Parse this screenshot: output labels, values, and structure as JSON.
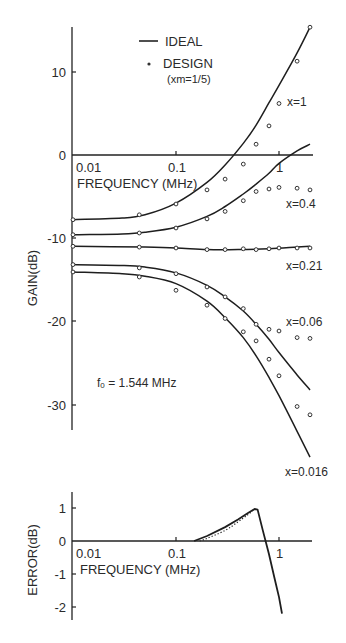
{
  "chart_data": [
    {
      "type": "line",
      "title": "",
      "xlabel": "FREQUENCY (MHz)",
      "ylabel": "GAIN(dB)",
      "xscale": "log",
      "xlim": [
        0.01,
        2.0
      ],
      "ylim": [
        -37,
        15.5
      ],
      "x_ticks": [
        "0.01",
        "0.1",
        "1"
      ],
      "y_ticks": [
        "10",
        "0",
        "-10",
        "-20",
        "-30"
      ],
      "grid": false,
      "legend": {
        "position": "top-center",
        "entries": [
          {
            "label": "IDEAL",
            "style": "solid-line"
          },
          {
            "label": "DESIGN",
            "sublabel": "(xm=1/5)",
            "style": "open-circle"
          }
        ]
      },
      "annotation": "f0 = 1.544 MHz",
      "series": [
        {
          "name": "x=1",
          "label": "x=1",
          "ideal_x": [
            0.01,
            0.03,
            0.05,
            0.1,
            0.2,
            0.3,
            0.45,
            0.6,
            0.8,
            1.0,
            1.5,
            2.0
          ],
          "ideal_y": [
            -7.8,
            -7.6,
            -7.2,
            -5.8,
            -3.3,
            -1.2,
            1.4,
            3.6,
            6.3,
            8.4,
            12.3,
            15.4
          ],
          "design_x": [
            0.01,
            0.044,
            0.1,
            0.2,
            0.3,
            0.45,
            0.6,
            0.8,
            1.0,
            1.5,
            2.0
          ],
          "design_y": [
            -7.8,
            -7.2,
            -5.9,
            -4.2,
            -2.9,
            -1.1,
            1.3,
            3.5,
            6.2,
            11.3,
            15.4
          ]
        },
        {
          "name": "x=0.4",
          "label": "x=0.4",
          "ideal_x": [
            0.01,
            0.03,
            0.05,
            0.1,
            0.2,
            0.3,
            0.45,
            0.6,
            0.8,
            1.0,
            1.5,
            2.0
          ],
          "ideal_y": [
            -9.6,
            -9.5,
            -9.3,
            -8.7,
            -7.4,
            -6.2,
            -4.7,
            -3.5,
            -2.2,
            -1.0,
            0.5,
            1.3
          ],
          "design_x": [
            0.01,
            0.044,
            0.1,
            0.2,
            0.3,
            0.45,
            0.6,
            0.8,
            1.0,
            1.5,
            2.0
          ],
          "design_y": [
            -9.6,
            -9.4,
            -8.8,
            -7.7,
            -6.8,
            -5.5,
            -4.4,
            -4.1,
            -3.9,
            -4.0,
            -4.2
          ]
        },
        {
          "name": "x=0.21",
          "label": "x=0.21",
          "ideal_x": [
            0.01,
            0.05,
            0.1,
            0.2,
            0.4,
            0.8,
            1.5,
            2.0
          ],
          "ideal_y": [
            -11.0,
            -11.1,
            -11.2,
            -11.4,
            -11.4,
            -11.3,
            -11.1,
            -11.0
          ],
          "design_x": [
            0.01,
            0.044,
            0.1,
            0.2,
            0.3,
            0.45,
            0.6,
            0.8,
            1.0,
            1.5,
            2.0
          ],
          "design_y": [
            -11.0,
            -11.1,
            -11.2,
            -11.4,
            -11.4,
            -11.3,
            -11.4,
            -11.3,
            -11.2,
            -11.2,
            -11.2
          ]
        },
        {
          "name": "x=0.06",
          "label": "x=0.06",
          "ideal_x": [
            0.01,
            0.03,
            0.05,
            0.1,
            0.2,
            0.3,
            0.45,
            0.6,
            0.8,
            1.0,
            1.5,
            2.0
          ],
          "ideal_y": [
            -13.2,
            -13.3,
            -13.5,
            -14.2,
            -15.7,
            -17.1,
            -18.8,
            -20.4,
            -22.2,
            -23.8,
            -26.5,
            -28.3
          ],
          "design_x": [
            0.01,
            0.044,
            0.1,
            0.2,
            0.3,
            0.45,
            0.6,
            0.8,
            1.0,
            1.5,
            2.0
          ],
          "design_y": [
            -13.2,
            -13.6,
            -14.3,
            -15.9,
            -17.1,
            -18.5,
            -20.4,
            -21.0,
            -21.2,
            -22.0,
            -22.1
          ]
        },
        {
          "name": "x=0.016",
          "label": "x=0.016",
          "ideal_x": [
            0.01,
            0.03,
            0.05,
            0.1,
            0.2,
            0.3,
            0.45,
            0.6,
            0.8,
            1.0,
            1.5,
            2.0
          ],
          "ideal_y": [
            -14.1,
            -14.3,
            -14.6,
            -15.5,
            -17.6,
            -19.6,
            -22.0,
            -24.2,
            -26.8,
            -29.0,
            -33.3,
            -36.4
          ],
          "design_x": [
            0.01,
            0.044,
            0.1,
            0.2,
            0.3,
            0.45,
            0.6,
            0.8,
            1.0,
            1.5,
            2.0
          ],
          "design_y": [
            -14.1,
            -14.7,
            -16.3,
            -18.1,
            -19.7,
            -21.3,
            -22.4,
            -24.6,
            -26.6,
            -30.3,
            -31.3
          ]
        }
      ]
    },
    {
      "type": "line",
      "title": "",
      "xlabel": "FREQUENCY (MHz)",
      "ylabel": "ERROR(dB)",
      "xscale": "log",
      "xlim": [
        0.01,
        2.0
      ],
      "ylim": [
        -2.4,
        1.5
      ],
      "x_ticks": [
        "0.01",
        "0.1",
        "1"
      ],
      "y_ticks": [
        "1",
        "0",
        "-1",
        "-2"
      ],
      "grid": false,
      "series": [
        {
          "name": "error-solid",
          "style": "solid",
          "x": [
            0.15,
            0.2,
            0.3,
            0.4,
            0.5,
            0.58,
            0.62,
            0.7,
            0.8,
            0.9,
            1.0,
            1.07
          ],
          "y": [
            0.0,
            0.15,
            0.42,
            0.65,
            0.85,
            0.97,
            0.95,
            0.3,
            -0.4,
            -1.1,
            -1.7,
            -2.2
          ]
        },
        {
          "name": "error-dotted",
          "style": "dotted",
          "x": [
            0.17,
            0.2,
            0.3,
            0.4,
            0.5,
            0.58
          ],
          "y": [
            0.0,
            0.08,
            0.32,
            0.58,
            0.8,
            0.97
          ]
        }
      ]
    }
  ],
  "labels": {
    "legend_ideal": "IDEAL",
    "legend_design": "DESIGN",
    "legend_design_sub": "(xm=1/5)",
    "xlabel_top": "FREQUENCY (MHz)",
    "xlabel_bottom": "FREQUENCY (MHz)",
    "ylabel_top": "GAIN(dB)",
    "ylabel_bottom": "ERROR(dB)",
    "f0_note": "f0 = 1.544 MHz",
    "f0_prefix": "f",
    "f0_sub": "0",
    "f0_rest": " = 1.544 MHz",
    "series_labels": [
      "x=1",
      "x=0.4",
      "x=0.21",
      "x=0.06",
      "x=0.016"
    ],
    "top_x_ticks": [
      "0.01",
      "0.1",
      "1"
    ],
    "top_y_ticks": [
      "10",
      "0",
      "-10",
      "-20",
      "-30"
    ],
    "bot_x_ticks": [
      "0.01",
      "0.1",
      "1"
    ],
    "bot_y_ticks": [
      "1",
      "0",
      "-1",
      "-2"
    ]
  }
}
